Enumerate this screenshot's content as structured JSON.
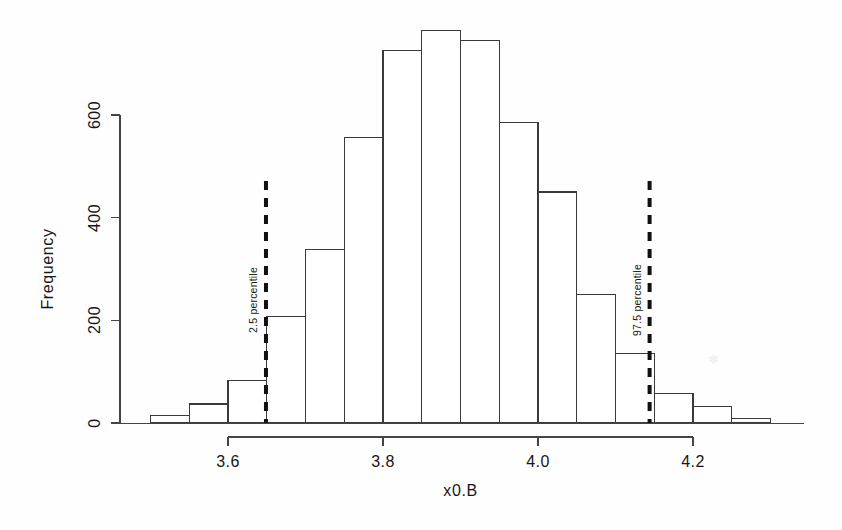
{
  "chart_data": {
    "type": "bar",
    "title": "",
    "subtitle": "",
    "xlabel": "x0.B",
    "ylabel": "Frequency",
    "xlim": [
      3.48,
      4.34
    ],
    "ylim": [
      0,
      780
    ],
    "grid": false,
    "legend": null,
    "bin_width": 0.05,
    "bin_edges": [
      3.5,
      3.55,
      3.6,
      3.65,
      3.7,
      3.75,
      3.8,
      3.85,
      3.9,
      3.95,
      4.0,
      4.05,
      4.1,
      4.15,
      4.2,
      4.25,
      4.3
    ],
    "categories": [
      "3.50-3.55",
      "3.55-3.60",
      "3.60-3.65",
      "3.65-3.70",
      "3.70-3.75",
      "3.75-3.80",
      "3.80-3.85",
      "3.85-3.90",
      "3.90-3.95",
      "3.95-4.00",
      "4.00-4.05",
      "4.05-4.10",
      "4.10-4.15",
      "4.15-4.20",
      "4.20-4.25",
      "4.25-4.30"
    ],
    "values": [
      15,
      37,
      82,
      207,
      338,
      557,
      725,
      764,
      745,
      586,
      450,
      251,
      135,
      58,
      33,
      8
    ],
    "x_ticks": [
      3.6,
      3.8,
      4.0,
      4.2
    ],
    "x_tick_labels": [
      "3.6",
      "3.8",
      "4.0",
      "4.2"
    ],
    "y_ticks": [
      0,
      200,
      400,
      600
    ],
    "y_tick_labels": [
      "0",
      "200",
      "400",
      "600"
    ],
    "annotations": [
      {
        "label": "2.5 percentile",
        "x": 3.649,
        "style": "dashed-vline"
      },
      {
        "label": "97.5 percentile",
        "x": 4.144,
        "style": "dashed-vline"
      }
    ],
    "colors": {
      "bar_fill": "#ffffff",
      "bar_stroke": "#3a3a3a",
      "axis": "#444444",
      "annotation_line": "#111111",
      "text": "#161616",
      "background": "#fefefe"
    }
  },
  "axes": {
    "x_title": "x0.B",
    "y_title": "Frequency"
  },
  "icons": {
    "smudge": "·"
  }
}
